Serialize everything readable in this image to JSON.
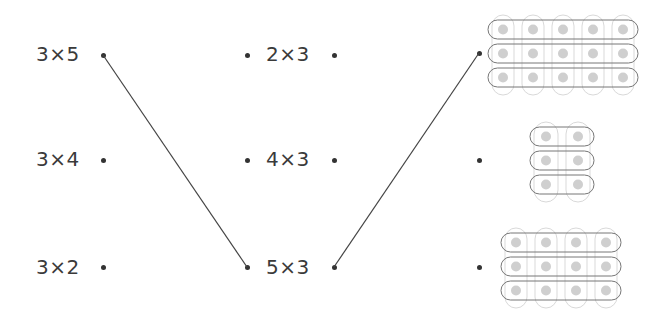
{
  "left_column": [
    {
      "label": "3×5",
      "x": 36,
      "y": 42,
      "dot": [
        103,
        55
      ]
    },
    {
      "label": "3×4",
      "x": 36,
      "y": 147,
      "dot": [
        103,
        160
      ]
    },
    {
      "label": "3×2",
      "x": 36,
      "y": 255,
      "dot": [
        103,
        267
      ]
    }
  ],
  "middle_column": [
    {
      "label": "2×3",
      "x": 266,
      "y": 42,
      "dot_left": [
        247,
        55
      ],
      "dot_right": [
        334,
        55
      ]
    },
    {
      "label": "4×3",
      "x": 266,
      "y": 147,
      "dot_left": [
        247,
        160
      ],
      "dot_right": [
        334,
        160
      ]
    },
    {
      "label": "5×3",
      "x": 266,
      "y": 255,
      "dot_left": [
        247,
        267
      ],
      "dot_right": [
        334,
        267
      ]
    }
  ],
  "right_dots": [
    [
      479,
      53
    ],
    [
      479,
      160
    ],
    [
      479,
      267
    ]
  ],
  "connections": [
    {
      "from": [
        103,
        55
      ],
      "to": [
        247,
        267
      ]
    },
    {
      "from": [
        334,
        267
      ],
      "to": [
        479,
        53
      ]
    }
  ],
  "arrays": [
    {
      "rows": 3,
      "cols": 5,
      "x": 488,
      "y": 20,
      "cell": 30,
      "row_h": 24
    },
    {
      "rows": 3,
      "cols": 2,
      "x": 530,
      "y": 127,
      "cell": 32,
      "row_h": 24
    },
    {
      "rows": 3,
      "cols": 4,
      "x": 501,
      "y": 233,
      "cell": 30,
      "row_h": 24
    }
  ],
  "colors": {
    "text": "#3a3a3a",
    "dot": "#333333",
    "line": "#444444",
    "row_outline": "#777777",
    "col_outline": "#d9d9d9",
    "bead": "#cfcfcf"
  }
}
